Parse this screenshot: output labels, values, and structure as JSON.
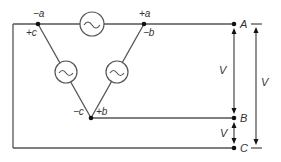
{
  "diagram": {
    "type": "three-phase delta source connection",
    "nodes": {
      "top_left": {
        "labels": [
          "−a",
          "+c"
        ]
      },
      "top_right": {
        "labels": [
          "+a",
          "−b"
        ]
      },
      "bottom": {
        "labels": [
          "−c",
          "+b"
        ]
      }
    },
    "sources": [
      {
        "name": "source-a",
        "symbol": "~"
      },
      {
        "name": "source-c",
        "symbol": "~"
      },
      {
        "name": "source-b",
        "symbol": "~"
      }
    ],
    "terminals": [
      "A",
      "B",
      "C"
    ],
    "voltages": {
      "ab": "V",
      "bc": "V",
      "ac": "V"
    },
    "colors": {
      "line": "#555555",
      "dot": "#111111",
      "text": "#333333"
    }
  }
}
